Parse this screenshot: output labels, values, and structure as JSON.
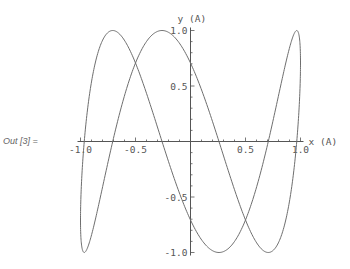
{
  "cell": {
    "out_label": "Out [3] ="
  },
  "chart_data": {
    "type": "line",
    "title": "",
    "xlabel": "x (A)",
    "ylabel": "y (A)",
    "xlim": [
      -1.0,
      1.0
    ],
    "ylim": [
      -1.0,
      1.0
    ],
    "grid": false,
    "parametric": {
      "x": "cos(t)",
      "y": "sin(3t + pi/4)",
      "t_range": [
        0,
        6.283185307
      ]
    },
    "x_ticks": [
      {
        "value": -1.0,
        "label": "-1.0"
      },
      {
        "value": -0.5,
        "label": "-0.5"
      },
      {
        "value": 0.5,
        "label": "0.5"
      },
      {
        "value": 1.0,
        "label": "1.0"
      }
    ],
    "y_ticks": [
      {
        "value": 1.0,
        "label": "1.0"
      },
      {
        "value": 0.5,
        "label": "0.5"
      },
      {
        "value": -0.5,
        "label": "-0.5"
      },
      {
        "value": -1.0,
        "label": "-1.0"
      }
    ],
    "minor_tick_step": 0.1,
    "series": [
      {
        "name": "lissajous",
        "color": "#6e6e6e"
      }
    ]
  }
}
